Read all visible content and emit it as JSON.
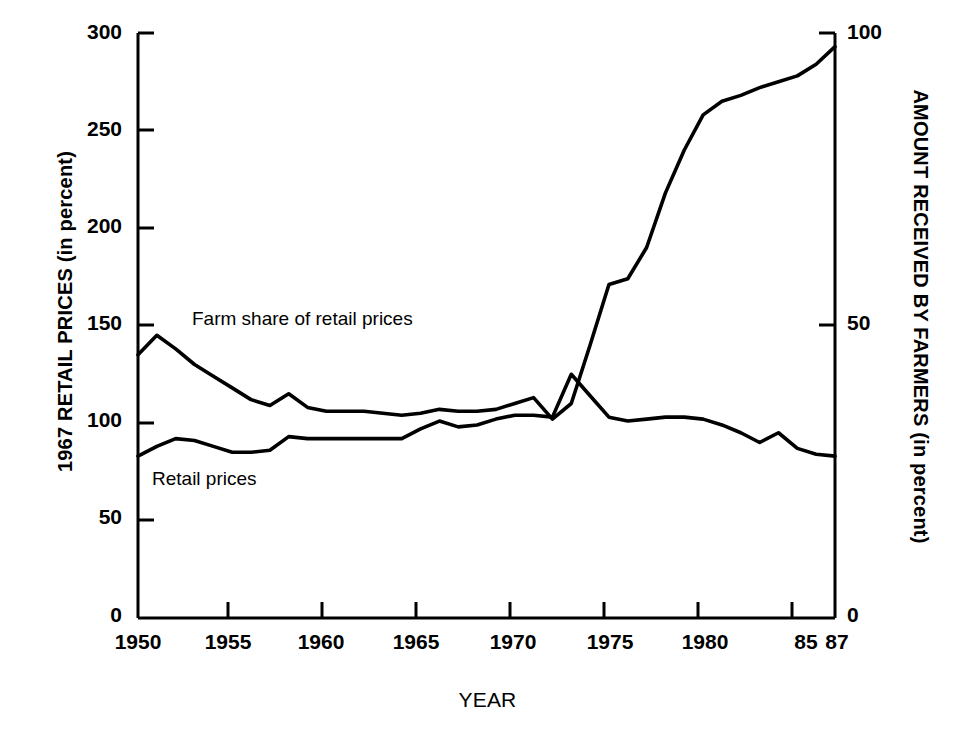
{
  "chart_data": {
    "type": "line",
    "title": "",
    "xlabel": "YEAR",
    "ylabel": "1967 RETAIL PRICES (in percent)",
    "ylabel_right": "AMOUNT RECEIVED BY FARMERS (in percent)",
    "xlim": [
      1950,
      1987
    ],
    "ylim": [
      0,
      300
    ],
    "ylim_right": [
      0,
      100
    ],
    "yticks": [
      0,
      50,
      100,
      150,
      200,
      250,
      300
    ],
    "ytick_labels": [
      "0",
      "50",
      "100",
      "150",
      "200",
      "250",
      "300"
    ],
    "yticks_right": [
      0,
      50,
      100
    ],
    "ytick_labels_right": [
      "0",
      "50",
      "100"
    ],
    "xticks": [
      1950,
      1955,
      1960,
      1965,
      1970,
      1975,
      1980,
      1985,
      1987
    ],
    "xtick_labels": [
      "1950",
      "1955",
      "1960",
      "1965",
      "1970",
      "1975",
      "1980",
      "85",
      "87"
    ],
    "grid": false,
    "legend_position": "inline-annotations",
    "x": [
      1950,
      1951,
      1952,
      1953,
      1954,
      1955,
      1956,
      1957,
      1958,
      1959,
      1960,
      1961,
      1962,
      1963,
      1964,
      1965,
      1966,
      1967,
      1968,
      1969,
      1970,
      1971,
      1972,
      1973,
      1974,
      1975,
      1976,
      1977,
      1978,
      1979,
      1980,
      1981,
      1982,
      1983,
      1984,
      1985,
      1986,
      1987
    ],
    "series": [
      {
        "name": "Farm share of retail prices",
        "values": [
          135,
          145,
          138,
          130,
          124,
          118,
          112,
          109,
          115,
          108,
          106,
          106,
          106,
          105,
          104,
          105,
          107,
          106,
          106,
          107,
          110,
          113,
          102,
          110,
          140,
          171,
          174,
          190,
          218,
          240,
          258,
          265,
          268,
          272,
          275,
          278,
          284,
          293
        ]
      },
      {
        "name": "Retail prices",
        "values": [
          83,
          88,
          92,
          91,
          88,
          85,
          85,
          86,
          93,
          92,
          92,
          92,
          92,
          92,
          92,
          97,
          101,
          98,
          99,
          102,
          104,
          104,
          103,
          125,
          114,
          103,
          101,
          102,
          103,
          103,
          102,
          99,
          95,
          90,
          95,
          87,
          84,
          83
        ]
      }
    ]
  },
  "axes": {
    "left": {
      "title": "1967 RETAIL PRICES (in percent)",
      "ticks": [
        "300",
        "250",
        "200",
        "150",
        "100",
        "50",
        "0"
      ]
    },
    "right": {
      "title": "AMOUNT RECEIVED BY FARMERS (in percent)",
      "ticks": [
        "100",
        "50",
        "0"
      ]
    },
    "bottom": {
      "title": "YEAR",
      "ticks": [
        "1950",
        "1955",
        "1960",
        "1965",
        "1970",
        "1975",
        "1980",
        "85",
        "87"
      ]
    }
  },
  "annotations": {
    "farm_share_label": "Farm share of retail prices",
    "retail_prices_label": "Retail prices"
  },
  "colors": {
    "line": "#000000",
    "axis": "#000000",
    "background": "#ffffff"
  }
}
